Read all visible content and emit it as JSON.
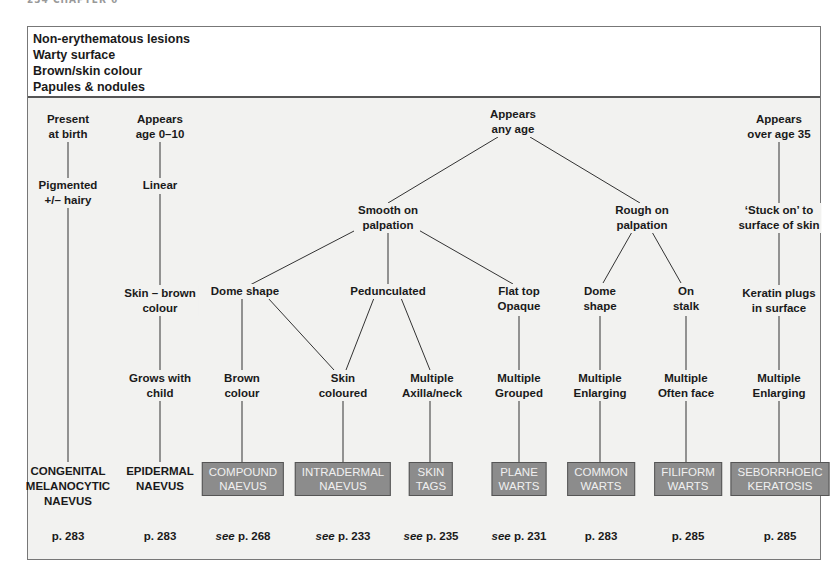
{
  "page_header": "234 CHAPTER 6",
  "header": {
    "lines": [
      "Non-erythematous lesions",
      "Warty surface",
      "Brown/skin colour",
      "Papules & nodules"
    ]
  },
  "nodes": {
    "present_at_birth": [
      "Present",
      "at birth"
    ],
    "pigmented_hairy": [
      "Pigmented",
      "+/– hairy"
    ],
    "appears_age_0_10": [
      "Appears",
      "age 0–10"
    ],
    "linear": [
      "Linear"
    ],
    "skin_brown_colour": [
      "Skin – brown",
      "colour"
    ],
    "grows_with_child": [
      "Grows with",
      "child"
    ],
    "appears_any_age": [
      "Appears",
      "any age"
    ],
    "smooth_on_palpation": [
      "Smooth on",
      "palpation"
    ],
    "rough_on_palpation": [
      "Rough on",
      "palpation"
    ],
    "dome_shape_smooth": [
      "Dome shape"
    ],
    "pedunculated": [
      "Pedunculated"
    ],
    "flat_top_opaque": [
      "Flat top",
      "Opaque"
    ],
    "dome_shape_rough": [
      "Dome",
      "shape"
    ],
    "on_stalk": [
      "On",
      "stalk"
    ],
    "brown_colour": [
      "Brown",
      "colour"
    ],
    "skin_coloured": [
      "Skin",
      "coloured"
    ],
    "multiple_axilla_neck": [
      "Multiple",
      "Axilla/neck"
    ],
    "multiple_grouped": [
      "Multiple",
      "Grouped"
    ],
    "multiple_enlarging_common": [
      "Multiple",
      "Enlarging"
    ],
    "multiple_often_face": [
      "Multiple",
      "Often face"
    ],
    "appears_over_35": [
      "Appears",
      "over age 35"
    ],
    "stuck_on": [
      "‘Stuck on’ to",
      "surface of skin"
    ],
    "keratin_plugs": [
      "Keratin plugs",
      "in surface"
    ],
    "multiple_enlarging_sebo": [
      "Multiple",
      "Enlarging"
    ]
  },
  "diagnoses": [
    {
      "id": "congenital",
      "lines": [
        "CONGENITAL",
        "MELANOCYTIC",
        "NAEVUS"
      ],
      "boxed": false,
      "see": false,
      "page": "p. 283"
    },
    {
      "id": "epidermal",
      "lines": [
        "EPIDERMAL",
        "NAEVUS"
      ],
      "boxed": false,
      "see": false,
      "page": "p. 283"
    },
    {
      "id": "compound",
      "lines": [
        "COMPOUND",
        "NAEVUS"
      ],
      "boxed": true,
      "see": true,
      "page": "p. 268"
    },
    {
      "id": "intradermal",
      "lines": [
        "INTRADERMAL",
        "NAEVUS"
      ],
      "boxed": true,
      "see": true,
      "page": "p. 233"
    },
    {
      "id": "skin_tags",
      "lines": [
        "SKIN",
        "TAGS"
      ],
      "boxed": true,
      "see": true,
      "page": "p. 235"
    },
    {
      "id": "plane_warts",
      "lines": [
        "PLANE",
        "WARTS"
      ],
      "boxed": true,
      "see": true,
      "page": "p. 231"
    },
    {
      "id": "common_warts",
      "lines": [
        "COMMON",
        "WARTS"
      ],
      "boxed": true,
      "see": false,
      "page": "p. 283"
    },
    {
      "id": "filiform_warts",
      "lines": [
        "FILIFORM",
        "WARTS"
      ],
      "boxed": true,
      "see": false,
      "page": "p. 285"
    },
    {
      "id": "seborrhoeic",
      "lines": [
        "SEBORRHOEIC",
        "KERATOSIS"
      ],
      "boxed": true,
      "see": false,
      "page": "p. 285"
    }
  ],
  "see_prefix": "see",
  "colors": {
    "box_fill": "#8c8c8c",
    "box_border": "#555555",
    "box_text": "#f0f0f0",
    "background": "#f2f2f0",
    "line": "#333333"
  }
}
